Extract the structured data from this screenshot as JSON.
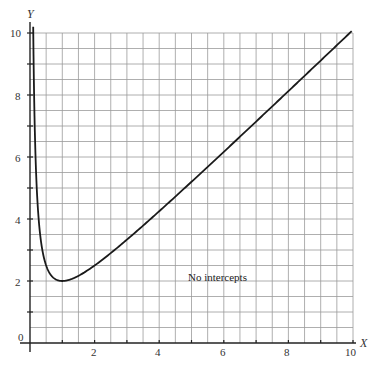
{
  "chart_data": {
    "type": "line",
    "title": "",
    "xlabel": "X",
    "ylabel": "Y",
    "xlim": [
      0,
      10
    ],
    "ylim": [
      0,
      10
    ],
    "grid": true,
    "grid_step": 0.5,
    "x_ticks": [
      "2",
      "4",
      "6",
      "8",
      "10"
    ],
    "y_ticks": [
      "0",
      "2",
      "4",
      "6",
      "8",
      "10"
    ],
    "function": "y = x + 1/x",
    "series": [
      {
        "name": "y = x + 1/x",
        "x": [
          0.1,
          0.2,
          0.3,
          0.5,
          0.75,
          1,
          1.5,
          2,
          3,
          4,
          5,
          6,
          7,
          8,
          9,
          10
        ],
        "y": [
          10.1,
          5.2,
          3.63,
          2.5,
          2.08,
          2,
          2.17,
          2.5,
          3.33,
          4.25,
          5.2,
          6.17,
          7.14,
          8.13,
          9.11,
          10.1
        ]
      }
    ],
    "annotations": [
      {
        "text": "No intercepts",
        "x": 6.2,
        "y": 2.5
      }
    ],
    "minimum": {
      "x": 1,
      "y": 2
    }
  },
  "labels": {
    "x_axis": "X",
    "y_axis": "Y",
    "note": "No intercepts",
    "x_tick_2": "2",
    "x_tick_4": "4",
    "x_tick_6": "6",
    "x_tick_8": "8",
    "x_tick_10": "10",
    "y_tick_0": "0",
    "y_tick_2": "2",
    "y_tick_4": "4",
    "y_tick_6": "6",
    "y_tick_8": "8",
    "y_tick_10": "10"
  }
}
